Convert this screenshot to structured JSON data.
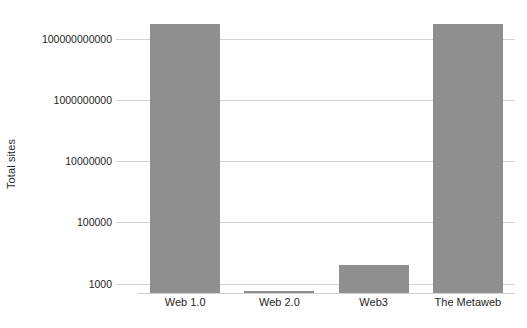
{
  "chart_data": {
    "type": "bar",
    "title": "",
    "subtitle": "",
    "xlabel": "",
    "ylabel": "Total sites",
    "yscale": "log",
    "ylim": [
      500,
      1000000000000
    ],
    "grid": true,
    "legend": false,
    "legend_position": "none",
    "bar_color": "#8f8f8f",
    "grid_color": "#d4d4d4",
    "categories": [
      "Web 1.0",
      "Web 2.0",
      "Web3",
      "The Metaweb"
    ],
    "values": [
      300000000000,
      500,
      4000,
      300000000000
    ],
    "ytick_labels": [
      "1000",
      "100000",
      "10000000",
      "1000000000",
      "100000000000"
    ],
    "ytick_values": [
      1000,
      100000,
      10000000,
      1000000000,
      100000000000
    ],
    "series": [
      {
        "name": "Total sites",
        "values": [
          300000000000,
          500,
          4000,
          300000000000
        ]
      }
    ]
  }
}
